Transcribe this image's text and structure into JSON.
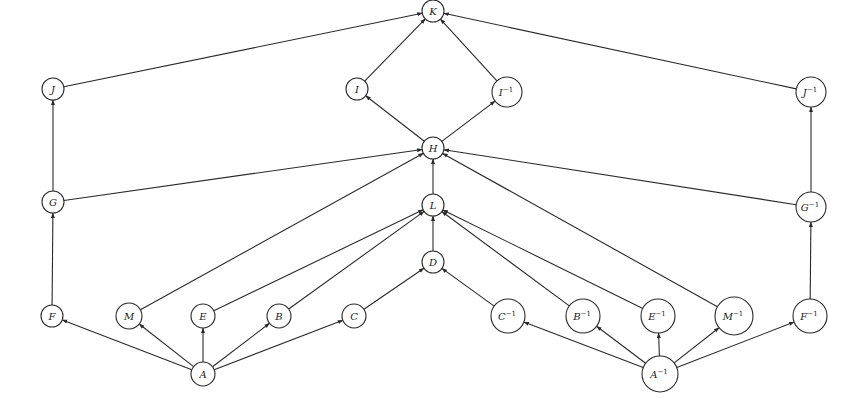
{
  "diagram": {
    "type": "directed-graph",
    "nodes": [
      {
        "id": "K",
        "base": "K",
        "sup": "",
        "x": 433,
        "y": 11,
        "r": 11
      },
      {
        "id": "I",
        "base": "I",
        "sup": "",
        "x": 357,
        "y": 89,
        "r": 11
      },
      {
        "id": "Iinv",
        "base": "I",
        "sup": "−1",
        "x": 507,
        "y": 92,
        "r": 15
      },
      {
        "id": "J",
        "base": "J",
        "sup": "",
        "x": 53,
        "y": 89,
        "r": 11
      },
      {
        "id": "Jinv",
        "base": "J",
        "sup": "−1",
        "x": 811,
        "y": 92,
        "r": 15
      },
      {
        "id": "H",
        "base": "H",
        "sup": "",
        "x": 433,
        "y": 148,
        "r": 11
      },
      {
        "id": "G",
        "base": "G",
        "sup": "",
        "x": 53,
        "y": 202,
        "r": 11
      },
      {
        "id": "Ginv",
        "base": "G",
        "sup": "−1",
        "x": 811,
        "y": 207,
        "r": 15
      },
      {
        "id": "L",
        "base": "L",
        "sup": "",
        "x": 433,
        "y": 205,
        "r": 11
      },
      {
        "id": "D",
        "base": "D",
        "sup": "",
        "x": 433,
        "y": 262,
        "r": 11
      },
      {
        "id": "F",
        "base": "F",
        "sup": "",
        "x": 52,
        "y": 316,
        "r": 11
      },
      {
        "id": "M",
        "base": "M",
        "sup": "",
        "x": 129,
        "y": 316,
        "r": 13
      },
      {
        "id": "E",
        "base": "E",
        "sup": "",
        "x": 203,
        "y": 316,
        "r": 12
      },
      {
        "id": "B",
        "base": "B",
        "sup": "",
        "x": 279,
        "y": 316,
        "r": 12
      },
      {
        "id": "C",
        "base": "C",
        "sup": "",
        "x": 354,
        "y": 316,
        "r": 12
      },
      {
        "id": "Cinv",
        "base": "C",
        "sup": "−1",
        "x": 508,
        "y": 316,
        "r": 17
      },
      {
        "id": "Binv",
        "base": "B",
        "sup": "−1",
        "x": 583,
        "y": 316,
        "r": 17
      },
      {
        "id": "Einv",
        "base": "E",
        "sup": "−1",
        "x": 658,
        "y": 316,
        "r": 17
      },
      {
        "id": "Minv",
        "base": "M",
        "sup": "−1",
        "x": 734,
        "y": 316,
        "r": 19
      },
      {
        "id": "Finv",
        "base": "F",
        "sup": "−1",
        "x": 810,
        "y": 316,
        "r": 17
      },
      {
        "id": "A",
        "base": "A",
        "sup": "",
        "x": 203,
        "y": 374,
        "r": 12
      },
      {
        "id": "Ainv",
        "base": "A",
        "sup": "−1",
        "x": 660,
        "y": 374,
        "r": 18
      }
    ],
    "edges": [
      {
        "from": "A",
        "to": "F"
      },
      {
        "from": "A",
        "to": "M"
      },
      {
        "from": "A",
        "to": "E"
      },
      {
        "from": "A",
        "to": "B"
      },
      {
        "from": "A",
        "to": "C"
      },
      {
        "from": "Ainv",
        "to": "Cinv"
      },
      {
        "from": "Ainv",
        "to": "Binv"
      },
      {
        "from": "Ainv",
        "to": "Einv"
      },
      {
        "from": "Ainv",
        "to": "Minv"
      },
      {
        "from": "Ainv",
        "to": "Finv"
      },
      {
        "from": "F",
        "to": "G"
      },
      {
        "from": "G",
        "to": "J"
      },
      {
        "from": "G",
        "to": "H"
      },
      {
        "from": "Finv",
        "to": "Ginv"
      },
      {
        "from": "Ginv",
        "to": "Jinv"
      },
      {
        "from": "Ginv",
        "to": "H"
      },
      {
        "from": "M",
        "to": "H"
      },
      {
        "from": "Minv",
        "to": "H"
      },
      {
        "from": "E",
        "to": "L"
      },
      {
        "from": "B",
        "to": "L"
      },
      {
        "from": "Einv",
        "to": "L"
      },
      {
        "from": "Binv",
        "to": "L"
      },
      {
        "from": "C",
        "to": "D"
      },
      {
        "from": "Cinv",
        "to": "D"
      },
      {
        "from": "D",
        "to": "L"
      },
      {
        "from": "L",
        "to": "H"
      },
      {
        "from": "H",
        "to": "I"
      },
      {
        "from": "H",
        "to": "Iinv"
      },
      {
        "from": "I",
        "to": "K"
      },
      {
        "from": "Iinv",
        "to": "K"
      },
      {
        "from": "J",
        "to": "K"
      },
      {
        "from": "Jinv",
        "to": "K"
      }
    ],
    "colors": {
      "stroke": "#2a2a2a",
      "background": "#ffffff"
    }
  }
}
